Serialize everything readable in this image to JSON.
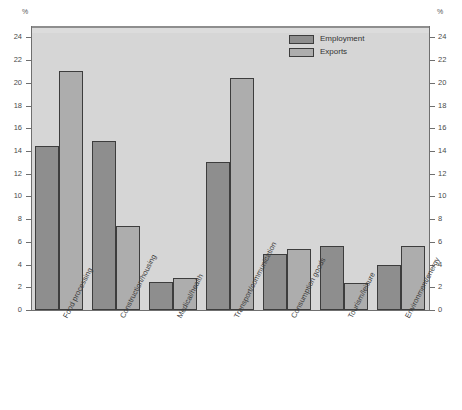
{
  "chart_data": {
    "type": "bar",
    "title": "",
    "xlabel": "",
    "ylabel": "%",
    "ylabel_right": "%",
    "ylim": [
      0,
      25
    ],
    "yticks": [
      0,
      2,
      4,
      6,
      8,
      10,
      12,
      14,
      16,
      18,
      20,
      22,
      24
    ],
    "ytick_labels": [
      "0",
      "2",
      "4",
      "6",
      "8",
      "10",
      "12",
      "14",
      "16",
      "18",
      "20",
      "22",
      "24"
    ],
    "grid": false,
    "legend_position": "top-right",
    "categories": [
      "Food processing",
      "Construction/housing",
      "Medical/health",
      "Transport/communication",
      "Consumption goods",
      "Tourism/leisure",
      "Environment/energy"
    ],
    "series": [
      {
        "name": "Employment",
        "color": "#8e8e8e",
        "values": [
          14.4,
          14.9,
          2.5,
          13.0,
          4.9,
          5.6,
          4.0
        ]
      },
      {
        "name": "Exports",
        "color": "#adadad",
        "values": [
          21.0,
          7.4,
          2.8,
          20.4,
          5.4,
          2.4,
          5.6
        ]
      }
    ]
  },
  "axis": {
    "unit_left": "%",
    "unit_right": "%"
  },
  "colors": {
    "plot_background": "#d6d6d6",
    "page_background": "#ffffff",
    "bar_outline": "#3d3d3d",
    "axis": "#6f6f6f",
    "employment": "#8e8e8e",
    "exports": "#adadad"
  }
}
